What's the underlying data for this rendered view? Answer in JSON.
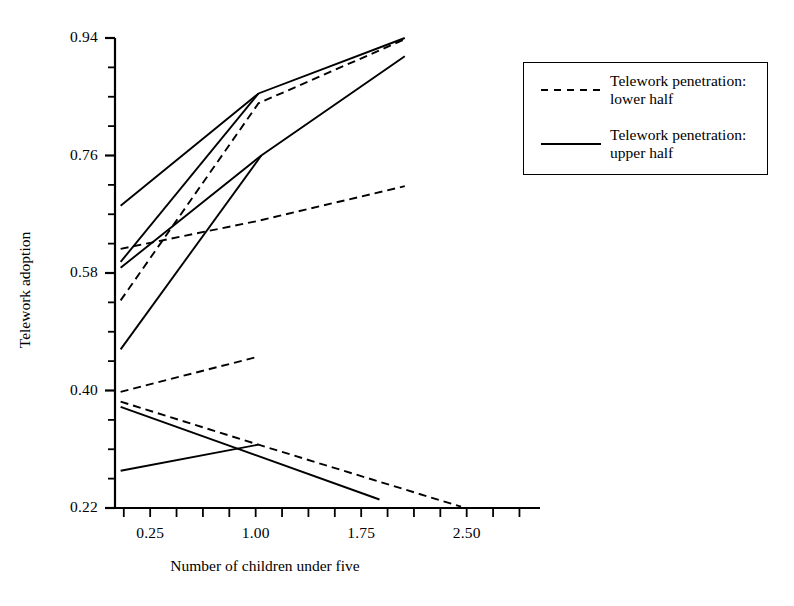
{
  "chart_data": {
    "type": "line",
    "title": "",
    "xlabel": "Number of children under five",
    "ylabel": "Telework adoption",
    "xlim": [
      0.0,
      2.95
    ],
    "ylim": [
      0.22,
      0.94
    ],
    "xticks": [
      0.25,
      1.0,
      1.75,
      2.5
    ],
    "xtick_labels": [
      "0.25",
      "1.00",
      "1.75",
      "2.50"
    ],
    "yticks": [
      0.22,
      0.4,
      0.58,
      0.76,
      0.94
    ],
    "ytick_labels": [
      "0.22",
      "0.40",
      "0.58",
      "0.76",
      "0.94"
    ],
    "grid": false,
    "legend_position": "upper right",
    "legend": [
      {
        "style": "dashed",
        "label_line1": "Telework penetration:",
        "label_line2": "lower half"
      },
      {
        "style": "solid",
        "label_line1": "Telework penetration:",
        "label_line2": "upper half"
      }
    ],
    "series": [
      {
        "name": "upper-half-top",
        "style": "solid",
        "points": [
          [
            0.04,
            0.683
          ],
          [
            1.02,
            0.855
          ],
          [
            2.06,
            0.94
          ]
        ]
      },
      {
        "name": "upper-half-second",
        "style": "solid",
        "points": [
          [
            0.04,
            0.597
          ],
          [
            1.02,
            0.855
          ]
        ]
      },
      {
        "name": "upper-half-third",
        "style": "solid",
        "points": [
          [
            0.04,
            0.588
          ],
          [
            1.04,
            0.76
          ],
          [
            2.06,
            0.912
          ]
        ]
      },
      {
        "name": "upper-half-fourth",
        "style": "solid",
        "points": [
          [
            0.04,
            0.463
          ],
          [
            1.04,
            0.76
          ]
        ]
      },
      {
        "name": "lower-half-steep",
        "style": "dashed",
        "points": [
          [
            0.04,
            0.538
          ],
          [
            1.02,
            0.84
          ],
          [
            2.06,
            0.938
          ]
        ]
      },
      {
        "name": "lower-half-shallow-upper",
        "style": "dashed",
        "points": [
          [
            0.04,
            0.617
          ],
          [
            1.02,
            0.66
          ],
          [
            2.06,
            0.713
          ]
        ]
      },
      {
        "name": "lower-half-mid-rising",
        "style": "dashed",
        "points": [
          [
            0.04,
            0.398
          ],
          [
            1.02,
            0.452
          ]
        ]
      },
      {
        "name": "lower-half-declining",
        "style": "dashed",
        "points": [
          [
            0.04,
            0.383
          ],
          [
            1.02,
            0.317
          ],
          [
            2.46,
            0.222
          ]
        ]
      },
      {
        "name": "upper-half-declining",
        "style": "solid",
        "points": [
          [
            0.04,
            0.375
          ],
          [
            1.88,
            0.233
          ]
        ]
      },
      {
        "name": "upper-half-rising-low",
        "style": "solid",
        "points": [
          [
            0.04,
            0.277
          ],
          [
            1.02,
            0.317
          ]
        ]
      }
    ]
  },
  "colors": {
    "line": "#000000",
    "axis": "#000000",
    "background": "#ffffff"
  }
}
